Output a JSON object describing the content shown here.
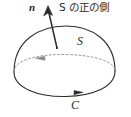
{
  "figure": {
    "width": 131,
    "height": 117,
    "background_color": "#ffffff",
    "stroke_color": "#2b2b2b",
    "dashed_stroke_color": "#8a8a8a"
  },
  "labels": {
    "normal_vector": "n",
    "positive_side": "S の正の側",
    "surface": "S",
    "curve": "C"
  },
  "elements": {
    "normal_arrow": {
      "name": "normal-vector-arrow",
      "from_x": 57,
      "from_y": 48,
      "to_x": 47,
      "to_y": 7
    },
    "dome_outline": {
      "name": "dome-surface-outline"
    },
    "boundary_curve": {
      "name": "boundary-curve-c",
      "arrow_direction": "right"
    },
    "hidden_edge": {
      "name": "hidden-equator-dashed-arc",
      "arrow_direction": "left",
      "style": "dashed"
    }
  }
}
